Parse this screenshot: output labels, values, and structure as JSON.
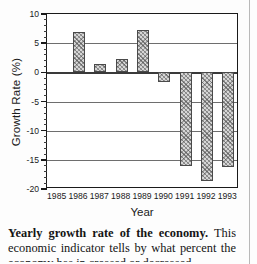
{
  "figure": {
    "ylabel": "Growth Rate (%)",
    "xlabel": "Year"
  },
  "caption": {
    "title": "Yearly growth rate of the economy.",
    "body": " This economic indicator tells by what percent the economy has in creased or decreased"
  },
  "chart_data": {
    "type": "bar",
    "title": "",
    "xlabel": "Year",
    "ylabel": "Growth Rate (%)",
    "categories": [
      "1985",
      "1986",
      "1987",
      "1988",
      "1989",
      "1990",
      "1991",
      "1992",
      "1993"
    ],
    "values": [
      null,
      7.0,
      1.5,
      2.3,
      7.3,
      -1.7,
      -16.0,
      -18.7,
      -16.2
    ],
    "ylim": [
      -20,
      10
    ],
    "yticks": [
      10,
      5,
      0,
      -5,
      -10,
      -15,
      -20
    ],
    "ytick_labels": [
      "10",
      "5",
      "0",
      "-5",
      "-10",
      "-15",
      "-20"
    ],
    "minor_ticks": true,
    "grid": "horizontal",
    "legend": "none",
    "bar_fill": "hatched-gray"
  }
}
